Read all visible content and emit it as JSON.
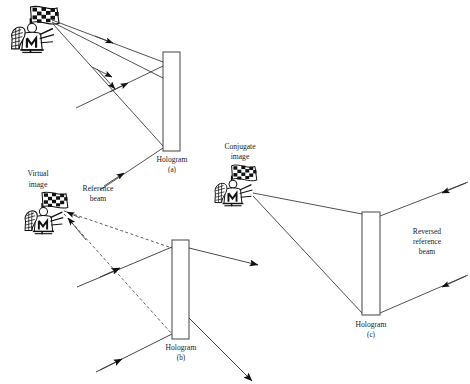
{
  "figure": {
    "background_color": "#ffffff",
    "line_color": "#1a1a1a",
    "panels": [
      {
        "id": "a",
        "caption_main": "Hologram",
        "caption_sub": "(a)",
        "role": "recording",
        "hologram": {
          "x": 163,
          "y": 52,
          "w": 17,
          "h": 99
        }
      },
      {
        "id": "b",
        "caption_main": "Hologram",
        "caption_sub": "(b)",
        "role": "reconstruction-virtual-image",
        "hologram": {
          "x": 172,
          "y": 240,
          "w": 17,
          "h": 99
        }
      },
      {
        "id": "c",
        "caption_main": "Hologram",
        "caption_sub": "(c)",
        "role": "reconstruction-conjugate-image",
        "hologram": {
          "x": 362,
          "y": 212,
          "w": 18,
          "h": 103
        }
      }
    ],
    "labels": {
      "virtual_image_line1": "Virtual",
      "virtual_image_line2": "image",
      "reference_beam_line1": "Reference",
      "reference_beam_line2": "beam",
      "conjugate_image_line1": "Conjugate",
      "conjugate_image_line2": "image",
      "reversed_reference_line1": "Reversed",
      "reversed_reference_line2": "reference",
      "reversed_reference_line3": "beam",
      "hologram_a_main": "Hologram",
      "hologram_a_sub": "(a)",
      "hologram_b_main": "Hologram",
      "hologram_b_sub": "(b)",
      "hologram_c_main": "Hologram",
      "hologram_c_sub": "(c)"
    },
    "objects": [
      {
        "name": "object-figure-a",
        "x": 8,
        "y": 6,
        "w": 56,
        "h": 58,
        "style": "solid"
      },
      {
        "name": "virtual-image-figure-b",
        "x": 22,
        "y": 192,
        "w": 50,
        "h": 54,
        "style": "solid"
      },
      {
        "name": "conjugate-image-figure-c",
        "x": 213,
        "y": 168,
        "w": 48,
        "h": 56,
        "style": "solid"
      }
    ]
  }
}
